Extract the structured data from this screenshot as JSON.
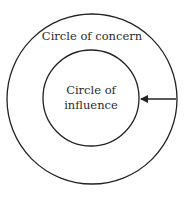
{
  "diagram": {
    "outer_circle": {
      "label": "Circle of concern",
      "cx": 92,
      "cy": 99,
      "r": 85
    },
    "inner_circle": {
      "label_line1": "Circle of",
      "label_line2": "influence",
      "cx": 91,
      "cy": 98,
      "r": 48
    },
    "arrow": {
      "from_x": 176,
      "to_x": 141,
      "y": 99,
      "direction": "left"
    },
    "colors": {
      "stroke": "#222222",
      "background": "#ffffff"
    }
  }
}
